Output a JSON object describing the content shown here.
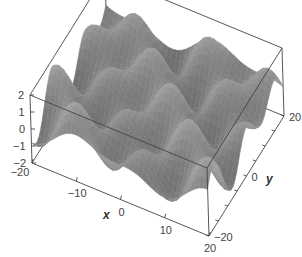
{
  "chart_data": {
    "type": "surface3d",
    "title": "",
    "function_description": "periodic wave surface z = f(x, y), peaks and troughs arranged in a grid",
    "xlabel": "x",
    "ylabel": "y",
    "zlabel": "",
    "xlim": [
      -20,
      20
    ],
    "ylim": [
      -20,
      20
    ],
    "zlim": [
      -2,
      2
    ],
    "x_ticks": [
      -20,
      -10,
      0,
      10,
      20
    ],
    "y_ticks": [
      -20,
      0,
      20
    ],
    "z_ticks": [
      -2,
      -1,
      0,
      1,
      2
    ],
    "x_tick_labels": [
      "−20",
      "−10",
      "0",
      "10",
      "20"
    ],
    "y_tick_labels": [
      "−20",
      "0",
      "20"
    ],
    "z_tick_labels": [
      "−2",
      "−1",
      "0",
      "1",
      "2"
    ],
    "surface_color": "#8a8a8a",
    "grid": false,
    "box": true
  },
  "axes": {
    "x_title": "x",
    "y_title": "y"
  }
}
